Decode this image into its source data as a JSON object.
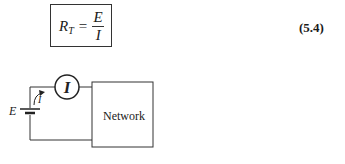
{
  "equation": {
    "lhs_symbol": "R",
    "lhs_subscript": "T",
    "operator": "=",
    "numerator": "E",
    "denominator": "I",
    "number": "(5.4)"
  },
  "circuit": {
    "source_label": "E",
    "ammeter_label": "I",
    "current_label": "I",
    "load_label": "Network",
    "icons": [
      "battery-icon",
      "ammeter-icon",
      "current-arrow-icon"
    ]
  }
}
